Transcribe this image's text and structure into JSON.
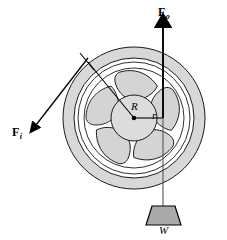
{
  "figure": {
    "background_color": "#ffffff",
    "line_color": "#000000",
    "fill_gray": "#d4d4d4",
    "fill_light": "#e0e0e0",
    "weight_fill": "#a8a8a8"
  },
  "labels": {
    "force_out": {
      "symbol": "F",
      "subscript": "o",
      "meaning": "output-force"
    },
    "force_in": {
      "symbol": "F",
      "subscript": "i",
      "meaning": "input-force"
    },
    "radius_large": {
      "symbol": "R",
      "meaning": "large-radius"
    },
    "radius_small": {
      "symbol": "r",
      "meaning": "small-radius"
    },
    "weight": {
      "symbol": "W",
      "meaning": "suspended-weight"
    }
  },
  "geometry": {
    "wheel_center": {
      "x": 134,
      "y": 118
    },
    "rim_outer_radius": 71,
    "rim_inner_radius": 60,
    "spoke_ring_radius": 50,
    "hub_radius": 23,
    "spoke_count": 5,
    "force_out_line_x": 163,
    "force_out_tip_y": 23,
    "force_in_start": {
      "x": 88,
      "y": 62
    },
    "force_in_tip": {
      "x": 31,
      "y": 130
    },
    "weight_top_y": 206,
    "weight_bottom_y": 225
  }
}
